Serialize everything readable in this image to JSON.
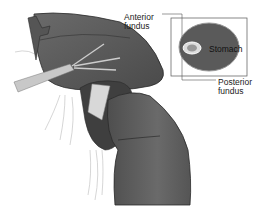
{
  "figure": {
    "labels": {
      "anterior_line1": "Anterior",
      "anterior_line2": "fundus",
      "stomach": "Stomach",
      "posterior_line1": "Posterior",
      "posterior_line2": "fundus"
    },
    "colors": {
      "tissue": "#5a5a5a",
      "tissue_dark": "#3f3f3f",
      "outline": "#2a2a2a",
      "instrument": "#bdbdbd",
      "background": "#ffffff"
    }
  }
}
